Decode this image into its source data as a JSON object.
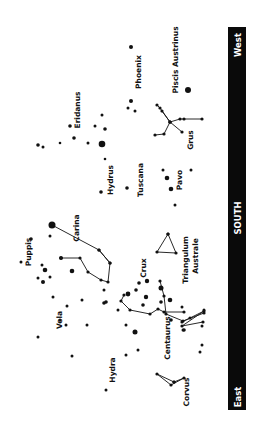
{
  "direction_bar": {
    "color": "#0a0a0a",
    "text_color": "#ffffff",
    "labels": {
      "west": "West",
      "south": "SOUTH",
      "east": "East"
    }
  },
  "constellations": [
    {
      "name": "Eridanus",
      "x": 80,
      "y": 110
    },
    {
      "name": "Phoenix",
      "x": 141,
      "y": 72
    },
    {
      "name": "Piscis Austrinus",
      "x": 178,
      "y": 60
    },
    {
      "name": "Grus",
      "x": 193,
      "y": 140
    },
    {
      "name": "Hydrus",
      "x": 113,
      "y": 180
    },
    {
      "name": "Tuscana",
      "x": 143,
      "y": 180
    },
    {
      "name": "Pavo",
      "x": 182,
      "y": 180
    },
    {
      "name": "Carina",
      "x": 79,
      "y": 228
    },
    {
      "name": "Puppis",
      "x": 31,
      "y": 252
    },
    {
      "name": "Crux",
      "x": 146,
      "y": 268
    },
    {
      "name": "Triangulum",
      "x": 188,
      "y": 260
    },
    {
      "name": "Australe",
      "x": 198,
      "y": 256
    },
    {
      "name": "Vela",
      "x": 62,
      "y": 320
    },
    {
      "name": "Centaurus",
      "x": 170,
      "y": 338
    },
    {
      "name": "Hydra",
      "x": 115,
      "y": 370
    },
    {
      "name": "Corvus",
      "x": 189,
      "y": 392
    }
  ],
  "stars": [
    [
      131,
      47,
      2
    ],
    [
      131,
      101,
      2
    ],
    [
      128,
      108,
      1.5
    ],
    [
      135,
      111,
      1.5
    ],
    [
      188,
      90,
      3
    ],
    [
      102,
      115,
      1.5
    ],
    [
      70,
      126,
      1.8
    ],
    [
      95,
      126,
      1.5
    ],
    [
      105,
      129,
      1.8
    ],
    [
      74,
      138,
      1.8
    ],
    [
      102,
      144,
      3.3
    ],
    [
      88,
      143,
      1.5
    ],
    [
      38,
      145,
      1.8
    ],
    [
      43,
      147,
      1.5
    ],
    [
      60,
      143,
      1.3
    ],
    [
      105,
      159,
      1.3
    ],
    [
      101,
      192,
      1.8
    ],
    [
      127,
      188,
      1.8
    ],
    [
      163,
      170,
      1.5
    ],
    [
      167,
      178,
      2.3
    ],
    [
      171,
      189,
      2.3
    ],
    [
      175,
      205,
      1.5
    ],
    [
      191,
      170,
      1.5
    ],
    [
      52,
      225,
      3.5
    ],
    [
      50,
      236,
      1.5
    ],
    [
      31,
      239,
      1.8
    ],
    [
      21,
      262,
      1.5
    ],
    [
      42,
      265,
      1.5
    ],
    [
      38,
      278,
      1.5
    ],
    [
      61,
      258,
      2
    ],
    [
      72,
      271,
      2.3
    ],
    [
      45,
      270,
      2.3
    ],
    [
      43,
      282,
      2
    ],
    [
      50,
      277,
      1.5
    ],
    [
      53,
      297,
      1.5
    ],
    [
      67,
      306,
      1.5
    ],
    [
      60,
      320,
      1.5
    ],
    [
      66,
      325,
      1.5
    ],
    [
      87,
      325,
      1.5
    ],
    [
      82,
      300,
      1.5
    ],
    [
      104,
      303,
      1.8
    ],
    [
      118,
      310,
      1.5
    ],
    [
      136,
      290,
      1.8
    ],
    [
      139,
      283,
      1.8
    ],
    [
      143,
      305,
      1.8
    ],
    [
      170,
      300,
      2.3
    ],
    [
      161,
      288,
      2.5
    ],
    [
      161,
      302,
      1.8
    ],
    [
      126,
      325,
      1.5
    ],
    [
      135,
      332,
      2.5
    ],
    [
      38,
      337,
      1.5
    ],
    [
      72,
      356,
      1.5
    ],
    [
      106,
      302,
      1.8
    ],
    [
      104,
      290,
      1.5
    ],
    [
      126,
      355,
      1.5
    ],
    [
      138,
      350,
      1.5
    ],
    [
      106,
      390,
      1.5
    ],
    [
      200,
      352,
      1.5
    ],
    [
      202,
      345,
      1.5
    ],
    [
      182,
      307,
      1.5
    ],
    [
      204,
      310,
      1.5
    ],
    [
      183,
      330,
      1.5
    ],
    [
      202,
      326,
      1.5
    ]
  ],
  "lines": [
    {
      "name": "carina",
      "points": [
        [
          52,
          225
        ],
        [
          99,
          250
        ],
        [
          110,
          263
        ],
        [
          108,
          282
        ],
        [
          101,
          280
        ],
        [
          88,
          272
        ],
        [
          80,
          258
        ],
        [
          61,
          258
        ]
      ]
    },
    {
      "name": "carina-spur",
      "points": [
        [
          99,
          250
        ],
        [
          110,
          263
        ]
      ]
    },
    {
      "name": "triangulum-australe",
      "points": [
        [
          168,
          234
        ],
        [
          157,
          252
        ],
        [
          176,
          253
        ],
        [
          168,
          234
        ]
      ]
    },
    {
      "name": "grus-a",
      "points": [
        [
          157,
          105
        ],
        [
          160,
          108
        ],
        [
          170,
          122
        ],
        [
          180,
          119
        ],
        [
          184,
          119
        ],
        [
          202,
          119
        ]
      ]
    },
    {
      "name": "grus-b",
      "points": [
        [
          162,
          111
        ],
        [
          170,
          122
        ],
        [
          182,
          132
        ]
      ]
    },
    {
      "name": "grus-c",
      "points": [
        [
          155,
          135
        ],
        [
          164,
          134
        ],
        [
          170,
          122
        ]
      ]
    },
    {
      "name": "centaurus-a",
      "points": [
        [
          124,
          295
        ],
        [
          121,
          301
        ],
        [
          130,
          310
        ],
        [
          150,
          314
        ],
        [
          158,
          309
        ],
        [
          164,
          312
        ],
        [
          184,
          312
        ]
      ]
    },
    {
      "name": "centaurus-b",
      "points": [
        [
          160,
          281
        ],
        [
          164,
          296
        ],
        [
          166,
          314
        ],
        [
          183,
          321
        ],
        [
          204,
          313
        ]
      ]
    },
    {
      "name": "centaurus-c",
      "points": [
        [
          182,
          322
        ],
        [
          190,
          318
        ],
        [
          204,
          311
        ],
        [
          182,
          326
        ],
        [
          203,
          322
        ]
      ]
    },
    {
      "name": "corvus",
      "points": [
        [
          174,
          382
        ],
        [
          157,
          374
        ],
        [
          171,
          385
        ],
        [
          184,
          378
        ],
        [
          174,
          382
        ]
      ]
    }
  ],
  "big_stars": [
    [
      147,
      281,
      2.2
    ],
    [
      146,
      297,
      2.2
    ],
    [
      128,
      294,
      2.4
    ],
    [
      171,
      320,
      1.8
    ],
    [
      184,
      330,
      1.8
    ]
  ]
}
